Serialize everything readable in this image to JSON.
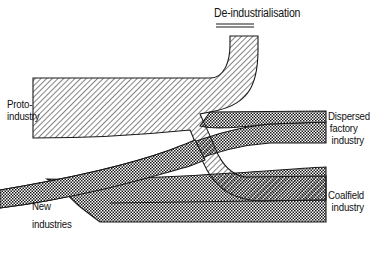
{
  "diagram": {
    "title": "De-industrialisation",
    "labels": {
      "proto_industry": [
        "Proto-",
        "industry"
      ],
      "dispersed_factory_industry": [
        "Dispersed",
        "factory",
        "industry"
      ],
      "coalfield_industry": [
        "Coalfield",
        "industry"
      ],
      "new_industries": [
        "New",
        "industries"
      ]
    },
    "legend": {
      "diagonal_hatch": "proto-industry flow",
      "crosshatch": "factory / new industry flow"
    },
    "colors": {
      "ink": "#1a1a1a",
      "background": "#ffffff"
    }
  }
}
